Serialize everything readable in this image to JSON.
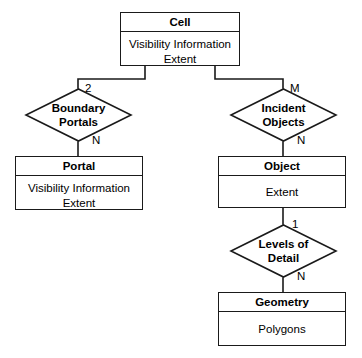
{
  "diagram": {
    "type": "entity-relationship",
    "entities": [
      {
        "id": "cell",
        "title": "Cell",
        "attributes": [
          "Visibility Information",
          "Extent"
        ]
      },
      {
        "id": "portal",
        "title": "Portal",
        "attributes": [
          "Visibility Information",
          "Extent"
        ]
      },
      {
        "id": "object",
        "title": "Object",
        "attributes": [
          "Extent"
        ]
      },
      {
        "id": "geometry",
        "title": "Geometry",
        "attributes": [
          "Polygons"
        ]
      }
    ],
    "relationships": [
      {
        "id": "boundary-portals",
        "line1": "Boundary",
        "line2": "Portals",
        "from": "cell",
        "to": "portal",
        "cardinality_top": "2",
        "cardinality_bottom": "N"
      },
      {
        "id": "incident-objects",
        "line1": "Incident",
        "line2": "Objects",
        "from": "cell",
        "to": "object",
        "cardinality_top": "M",
        "cardinality_bottom": "N"
      },
      {
        "id": "levels-of-detail",
        "line1": "Levels of",
        "line2": "Detail",
        "from": "object",
        "to": "geometry",
        "cardinality_top": "1",
        "cardinality_bottom": "N"
      }
    ],
    "colors": {
      "stroke": "#1a1a1a",
      "fill": "#ffffff",
      "background": "#ffffff",
      "text": "#000000"
    }
  }
}
